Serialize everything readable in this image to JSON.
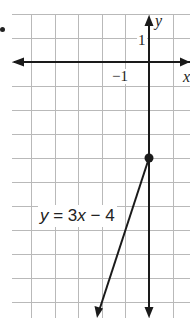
{
  "chart_data": {
    "type": "line",
    "title": "",
    "equation": "y = 3x - 4",
    "series": [
      {
        "name": "y = 3x - 4",
        "slope": 3,
        "intercept": -4,
        "x": [
          0,
          -2.15
        ],
        "y": [
          -4,
          -10.45
        ]
      }
    ],
    "points": [
      {
        "x": 0,
        "y": -4,
        "label": "y-intercept"
      }
    ],
    "xlabel": "x",
    "ylabel": "y",
    "x_tick_labels": [
      {
        "value": -1,
        "label": "−1"
      }
    ],
    "y_tick_labels": [
      {
        "value": 1,
        "label": "1"
      }
    ],
    "xlim": [
      -6,
      1.7
    ],
    "ylim": [
      -10.75,
      1.95
    ],
    "grid": true,
    "grid_unit": 1
  },
  "labels": {
    "x_axis": "x",
    "y_axis": "y",
    "tick_x_neg1": "−1",
    "tick_y_1": "1",
    "eq_y": "y",
    "eq_mid": " = 3",
    "eq_x": "x",
    "eq_end": " − 4"
  },
  "colors": {
    "grid": "#b9b9b9",
    "axis": "#1a1a1a",
    "line": "#1a1a1a"
  }
}
